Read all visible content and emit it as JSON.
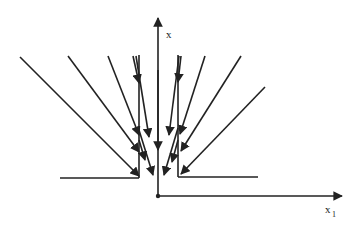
{
  "diagram": {
    "type": "vector-field-phase-diagram",
    "axes": {
      "vertical_label": "x",
      "horizontal_label": "x",
      "horizontal_label_subscript": "1"
    },
    "colors": {
      "line": "#222222",
      "background": "#ffffff"
    }
  }
}
